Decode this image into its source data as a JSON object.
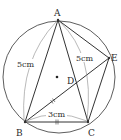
{
  "diagram": {
    "type": "geometry-figure",
    "colors": {
      "stroke": "#333333",
      "thin_arc": "#8a8a8a",
      "text": "#2a2a2a",
      "background": "#ffffff"
    },
    "points": {
      "A": {
        "label": "A"
      },
      "B": {
        "label": "B"
      },
      "C": {
        "label": "C"
      },
      "D": {
        "label": "D"
      },
      "E": {
        "label": "E"
      }
    },
    "measurements": {
      "AB": "5cm",
      "AC": "5cm",
      "BC": "3cm"
    },
    "marks": {
      "bc_equal_mark": "=",
      "bd_equal_mark": "="
    },
    "center_dot": "circle center"
  }
}
